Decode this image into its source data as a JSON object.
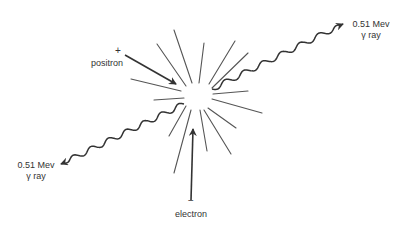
{
  "figure": {
    "colors": {
      "ink": "#333333",
      "ray_light": "#555555",
      "background": "#ffffff"
    },
    "center": {
      "x": 198,
      "y": 96
    },
    "burst_rays": [
      {
        "x1": 174,
        "y1": 30,
        "x2": 192,
        "y2": 83
      },
      {
        "x1": 157,
        "y1": 44,
        "x2": 186,
        "y2": 86
      },
      {
        "x1": 204,
        "y1": 43,
        "x2": 199,
        "y2": 83
      },
      {
        "x1": 235,
        "y1": 41,
        "x2": 209,
        "y2": 84
      },
      {
        "x1": 248,
        "y1": 53,
        "x2": 212,
        "y2": 88
      },
      {
        "x1": 131,
        "y1": 79,
        "x2": 181,
        "y2": 91
      },
      {
        "x1": 154,
        "y1": 100,
        "x2": 184,
        "y2": 98
      },
      {
        "x1": 248,
        "y1": 91,
        "x2": 213,
        "y2": 94
      },
      {
        "x1": 262,
        "y1": 113,
        "x2": 212,
        "y2": 99
      },
      {
        "x1": 169,
        "y1": 136,
        "x2": 186,
        "y2": 106
      },
      {
        "x1": 174,
        "y1": 173,
        "x2": 191,
        "y2": 110
      },
      {
        "x1": 207,
        "y1": 151,
        "x2": 200,
        "y2": 110
      },
      {
        "x1": 236,
        "y1": 128,
        "x2": 208,
        "y2": 108
      },
      {
        "x1": 231,
        "y1": 154,
        "x2": 204,
        "y2": 110
      }
    ],
    "particles": {
      "positron": {
        "sign": "+",
        "label": "positron",
        "arrow": {
          "x1": 125,
          "y1": 55,
          "x2": 176,
          "y2": 84
        }
      },
      "electron": {
        "sign": "−",
        "label": "electron",
        "arrow": {
          "x1": 191,
          "y1": 200,
          "x2": 193,
          "y2": 129
        }
      }
    },
    "gamma_rays": [
      {
        "id": "upper-right",
        "energy_label": "0.51 Mev",
        "type_label": "γ ray",
        "start": {
          "x": 212,
          "y": 89
        },
        "end": {
          "x": 343,
          "y": 24
        }
      },
      {
        "id": "lower-left",
        "energy_label": "0.51 Mev",
        "type_label": "γ ray",
        "start": {
          "x": 184,
          "y": 104
        },
        "end": {
          "x": 61,
          "y": 164
        }
      }
    ]
  }
}
